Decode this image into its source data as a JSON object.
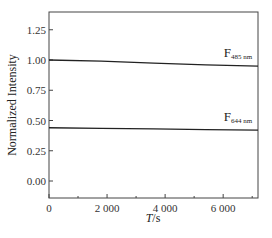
{
  "chart_data": {
    "type": "line",
    "title": "",
    "xlabel": "T/s",
    "xlabel_italic": "T",
    "xlabel_unit": "/s",
    "ylabel": "Normalized Intensity",
    "xlim": [
      0,
      7200
    ],
    "ylim": [
      -0.15,
      1.42
    ],
    "x_ticks": [
      0,
      2000,
      4000,
      6000
    ],
    "x_tick_labels": [
      "0",
      "2 000",
      "4 000",
      "6 000"
    ],
    "x_minor_ticks": [
      1000,
      3000,
      5000,
      7000
    ],
    "y_ticks": [
      0.0,
      0.25,
      0.5,
      0.75,
      1.0,
      1.25
    ],
    "y_tick_labels": [
      "0.00",
      "0.25",
      "0.50",
      "0.75",
      "1.00",
      "1.25"
    ],
    "grid": false,
    "legend": "inline annotations",
    "series": [
      {
        "name": "F485 nm",
        "label_main": "F",
        "label_sub": "485 nm",
        "x": [
          0,
          1800,
          3600,
          5400,
          7200
        ],
        "values": [
          1.0,
          0.99,
          0.975,
          0.96,
          0.95
        ],
        "color": "#222222"
      },
      {
        "name": "F644 nm",
        "label_main": "F",
        "label_sub": "644 nm",
        "x": [
          0,
          1800,
          3600,
          5400,
          7200
        ],
        "values": [
          0.44,
          0.435,
          0.43,
          0.425,
          0.42
        ],
        "color": "#222222"
      }
    ]
  },
  "colors": {
    "axis": "#444444",
    "line": "#222222",
    "background": "#ffffff"
  }
}
